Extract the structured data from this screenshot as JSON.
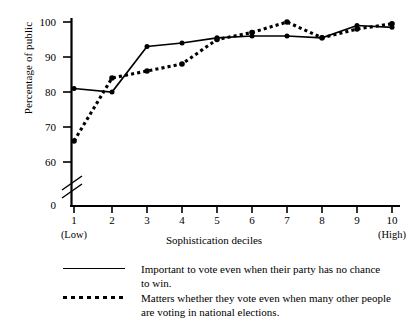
{
  "chart_data": {
    "type": "line",
    "title": "",
    "xlabel": "Sophistication deciles",
    "ylabel": "Percentage of public",
    "categories": [
      "1",
      "2",
      "3",
      "4",
      "5",
      "6",
      "7",
      "8",
      "9",
      "10"
    ],
    "category_notes": {
      "first": "(Low)",
      "last": "(High)"
    },
    "yticks": [
      0,
      60,
      70,
      80,
      90,
      100
    ],
    "ylim": [
      0,
      103
    ],
    "y_axis_break": true,
    "y_axis_break_between": [
      0,
      60
    ],
    "grid": false,
    "legend_position": "below",
    "series": [
      {
        "name": "Important to vote even when their party has no chance to win.",
        "style": "solid",
        "values": [
          81,
          80,
          93,
          94,
          95.5,
          96,
          96,
          95.5,
          99,
          98.5
        ]
      },
      {
        "name": "Matters whether they vote even when many other people are voting in national elections.",
        "style": "dotted",
        "values": [
          66,
          84,
          86,
          88,
          95,
          97,
          100,
          95.5,
          98,
          99.5
        ]
      }
    ]
  },
  "axis": {
    "ylabel": "Percentage of public",
    "xlabel": "Sophistication deciles",
    "ytick_labels": [
      "100",
      "90",
      "80",
      "70",
      "60",
      "0"
    ],
    "xtick_labels": [
      "1",
      "2",
      "3",
      "4",
      "5",
      "6",
      "7",
      "8",
      "9",
      "10"
    ],
    "xtick_sub_low": "(Low)",
    "xtick_sub_high": "(High)"
  },
  "legend": {
    "entries": [
      {
        "key": "solid-line-key",
        "line1": "Important to vote even when their party has no chance",
        "line2": "to win."
      },
      {
        "key": "dotted-line-key",
        "line1": "Matters whether they vote even when many other people",
        "line2": "are voting in national elections."
      }
    ]
  },
  "colors": {
    "ink": "#000000",
    "background": "#ffffff"
  }
}
